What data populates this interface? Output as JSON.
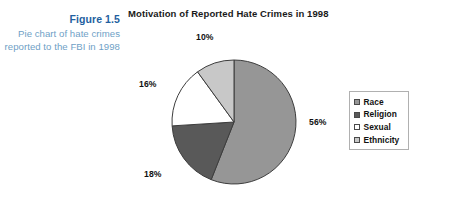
{
  "caption": {
    "figure_number": "Figure 1.5",
    "description": "Pie chart of hate crimes reported to the FBI in 1998"
  },
  "chart_data": {
    "type": "pie",
    "title": "Motivation of Reported Hate Crimes in 1998",
    "xlabel": "",
    "ylabel": "",
    "legend_position": "right",
    "start_angle_deg": 0,
    "direction": "clockwise",
    "categories": [
      "Race",
      "Religion",
      "Sexual",
      "Ethnicity"
    ],
    "values": [
      56,
      18,
      16,
      10
    ],
    "value_labels": [
      "56%",
      "18%",
      "16%",
      "10%"
    ],
    "colors": [
      "#969696",
      "#595959",
      "#ffffff",
      "#c8c8c8"
    ],
    "slice_border_color": "#3d3d3d",
    "slices": [
      {
        "label": "Race",
        "value": 56,
        "display": "56%",
        "color": "#969696"
      },
      {
        "label": "Religion",
        "value": 18,
        "display": "18%",
        "color": "#595959"
      },
      {
        "label": "Sexual",
        "value": 16,
        "display": "16%",
        "color": "#ffffff"
      },
      {
        "label": "Ethnicity",
        "value": 10,
        "display": "10%",
        "color": "#c8c8c8"
      }
    ]
  },
  "legend": {
    "items": [
      {
        "label": "Race",
        "color": "#969696"
      },
      {
        "label": "Religion",
        "color": "#595959"
      },
      {
        "label": "Sexual",
        "color": "#ffffff"
      },
      {
        "label": "Ethnicity",
        "color": "#c8c8c8"
      }
    ]
  },
  "colors": {
    "caption_title": "#1f5fa0",
    "caption_body": "#6f9fc6",
    "title_text": "#1a1a1a",
    "background": "#ffffff"
  }
}
